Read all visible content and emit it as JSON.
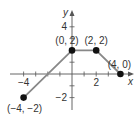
{
  "chart_data": {
    "type": "line",
    "title": "",
    "xlabel": "x",
    "ylabel": "y",
    "xlim": [
      -5,
      5
    ],
    "ylim": [
      -3,
      5
    ],
    "x_ticks": [
      -4,
      -3,
      -2,
      -1,
      1,
      2,
      3,
      4
    ],
    "y_ticks": [
      -2,
      -1,
      1,
      2,
      3,
      4
    ],
    "x_tick_labels": [
      {
        "value": -4,
        "label": "−4"
      },
      {
        "value": 2,
        "label": "2"
      }
    ],
    "y_tick_labels": [
      {
        "value": 4,
        "label": "4"
      },
      {
        "value": -2,
        "label": "−2"
      }
    ],
    "series": [
      {
        "name": "piecewise",
        "points": [
          [
            -4,
            -2
          ],
          [
            0,
            2
          ],
          [
            2,
            2
          ],
          [
            4,
            0
          ]
        ],
        "color": "#888888"
      }
    ],
    "point_labels": [
      {
        "x": -4,
        "y": -2,
        "label": "(−4, −2)",
        "anchor": "below"
      },
      {
        "x": 0,
        "y": 2,
        "label": "(0, 2)",
        "anchor": "above-left"
      },
      {
        "x": 2,
        "y": 2,
        "label": "(2, 2)",
        "anchor": "above"
      },
      {
        "x": 4,
        "y": 0,
        "label": "(4, 0)",
        "anchor": "above"
      }
    ],
    "grid": false
  }
}
